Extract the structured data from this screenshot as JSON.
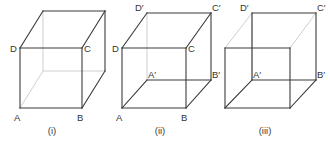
{
  "figure": {
    "background_color": "#ffffff",
    "line_color_visible": "#3b3b3b",
    "line_color_hidden": "#c9c9c9",
    "text_color": "#333333",
    "panels": [
      {
        "id": "panel-i",
        "caption": "(i)",
        "labels": [
          {
            "id": "i-D",
            "text": "D"
          },
          {
            "id": "i-C",
            "text": "C"
          },
          {
            "id": "i-A",
            "text": "A"
          },
          {
            "id": "i-B",
            "text": "B"
          }
        ]
      },
      {
        "id": "panel-ii",
        "caption": "(ii)",
        "labels": [
          {
            "id": "ii-Dp",
            "text": "D′"
          },
          {
            "id": "ii-Cp",
            "text": "C′"
          },
          {
            "id": "ii-D",
            "text": "D"
          },
          {
            "id": "ii-C",
            "text": "C"
          },
          {
            "id": "ii-Ap",
            "text": "A′"
          },
          {
            "id": "ii-Bp",
            "text": "B′"
          },
          {
            "id": "ii-A",
            "text": "A"
          },
          {
            "id": "ii-B",
            "text": "B"
          }
        ]
      },
      {
        "id": "panel-iii",
        "caption": "(iii)",
        "labels": [
          {
            "id": "iii-Dp",
            "text": "D′"
          },
          {
            "id": "iii-Cp",
            "text": "C′"
          },
          {
            "id": "iii-Ap",
            "text": "A′"
          },
          {
            "id": "iii-Bp",
            "text": "B′"
          }
        ]
      }
    ]
  }
}
